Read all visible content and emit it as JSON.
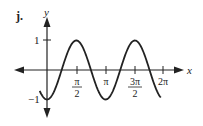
{
  "label": "j.",
  "axes": {
    "x_label": "x",
    "y_label": "y"
  },
  "x_ticks": [
    {
      "num": "π",
      "den": "2"
    },
    {
      "num": "π",
      "den": ""
    },
    {
      "num": "3π",
      "den": "2"
    },
    {
      "num": "2π",
      "den": ""
    }
  ],
  "y_ticks": [
    "1",
    "−1"
  ],
  "chart_data": {
    "type": "line",
    "title": "j.",
    "xlabel": "x",
    "ylabel": "y",
    "function": "y = -cos(2x)",
    "xlim": [
      -0.4,
      6.2
    ],
    "ylim": [
      -1,
      1
    ],
    "x_tick_values": [
      1.5708,
      3.1416,
      4.7124,
      6.2832
    ],
    "x_tick_labels": [
      "π/2",
      "π",
      "3π/2",
      "2π"
    ],
    "y_tick_values": [
      1,
      -1
    ],
    "y_tick_labels": [
      "1",
      "-1"
    ],
    "series": [
      {
        "name": "curve",
        "x": [
          -0.39,
          0,
          0.785,
          1.571,
          2.356,
          3.142,
          3.927,
          4.712,
          5.498,
          6.1
        ],
        "values": [
          -0.71,
          -1,
          0,
          1,
          0,
          -1,
          0,
          1,
          0,
          -0.93
        ]
      }
    ],
    "grid": false,
    "legend": "none"
  }
}
